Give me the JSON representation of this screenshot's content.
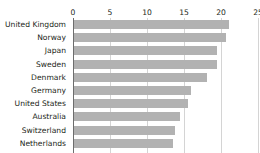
{
  "top_cut_text": "",
  "chart_data": {
    "type": "bar",
    "orientation": "horizontal",
    "title": "",
    "subtitle": "",
    "xlabel": "",
    "ylabel": "",
    "xlim": [
      0,
      25
    ],
    "xticks": [
      0,
      5,
      10,
      15,
      20,
      25
    ],
    "xtick_labels": [
      "0",
      "5",
      "10",
      "15",
      "20",
      "25"
    ],
    "grid": true,
    "legend": null,
    "bar_color": "#b2b2b2",
    "axis_color": "#6d6d6d",
    "gridline_color": "#d4d4d4",
    "text_color": "#231f20",
    "categories": [
      "United Kingdom",
      "Norway",
      "Japan",
      "Sweden",
      "Denmark",
      "Germany",
      "United States",
      "Australia",
      "Switzerland",
      "Netherlands"
    ],
    "values": [
      20.9,
      20.5,
      19.3,
      19.3,
      18.0,
      15.8,
      15.4,
      14.3,
      13.6,
      13.4
    ]
  }
}
